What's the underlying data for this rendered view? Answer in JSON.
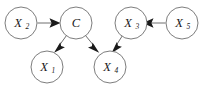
{
  "figure": {
    "width": 204,
    "height": 88,
    "background_color": "#ffffff",
    "node_stroke_color": "#6e6e6e",
    "node_fill_color": "#ffffff",
    "edge_color": "#6e6e6e",
    "arrowhead_color": "#1a1a1a",
    "label_color": "#1a1a1a"
  },
  "nodes": [
    {
      "id": "X2",
      "base": "X",
      "subscript": "2",
      "label": "X2",
      "cx": 21,
      "cy": 23,
      "r": 16
    },
    {
      "id": "C",
      "base": "C",
      "subscript": "",
      "label": "C",
      "cx": 76,
      "cy": 23,
      "r": 16
    },
    {
      "id": "X3",
      "base": "X",
      "subscript": "3",
      "label": "X3",
      "cx": 131,
      "cy": 23,
      "r": 16
    },
    {
      "id": "X5",
      "base": "X",
      "subscript": "5",
      "label": "X5",
      "cx": 182,
      "cy": 23,
      "r": 16
    },
    {
      "id": "X1",
      "base": "X",
      "subscript": "1",
      "label": "X1",
      "cx": 47,
      "cy": 67,
      "r": 16
    },
    {
      "id": "X4",
      "base": "X",
      "subscript": "4",
      "label": "X4",
      "cx": 110,
      "cy": 67,
      "r": 16
    }
  ],
  "edges": [
    {
      "id": "X2-C",
      "from": "X2",
      "to": "C",
      "directed": true,
      "style": "solid"
    },
    {
      "id": "C-X1",
      "from": "C",
      "to": "X1",
      "directed": true,
      "style": "solid"
    },
    {
      "id": "C-X4",
      "from": "C",
      "to": "X4",
      "directed": true,
      "style": "solid"
    },
    {
      "id": "X3-X4",
      "from": "X3",
      "to": "X4",
      "directed": true,
      "style": "solid"
    },
    {
      "id": "X5-X3",
      "from": "X5",
      "to": "X3",
      "directed": true,
      "style": "solid"
    }
  ]
}
